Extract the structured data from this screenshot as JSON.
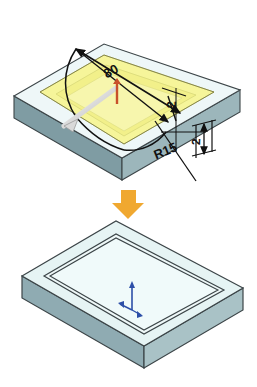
{
  "figure": {
    "background_color": "#ffffff",
    "type": "cad-isometric-illustration"
  },
  "colors": {
    "block_top": "#eef7f8",
    "block_top_lower": "#e6f4f4",
    "block_side_front": "#7f9ca3",
    "block_side_right": "#9cb6bb",
    "block_side_front_lower": "#8fabb2",
    "block_side_right_lower": "#a9c2c6",
    "sketch_fill": "#f6f59a",
    "sketch_fill_deep": "#f2f08a",
    "edge_line": "#3c4548",
    "dimension_line": "#111111",
    "arrow_orange": "#f0a830",
    "handle_gray": "#cfcfcf",
    "handle_red": "#c8502a",
    "axis_blue": "#2d4fa8"
  },
  "upper_model": {
    "name": "block-with-sketch",
    "sketch_region_label": "extrude-cut-profile",
    "dimensions": [
      {
        "id": "length",
        "value": "80",
        "kind": "linear",
        "rotation": -28,
        "x": 113,
        "y": 75
      },
      {
        "id": "width",
        "value": "2",
        "kind": "linear",
        "rotation": -88,
        "x": 174,
        "y": 108
      },
      {
        "id": "corner-radius",
        "value": "R15",
        "kind": "radial",
        "rotation": -22,
        "x": 167,
        "y": 155
      },
      {
        "id": "depth",
        "value": "2",
        "kind": "linear",
        "rotation": -88,
        "x": 200,
        "y": 142
      }
    ]
  },
  "transition": {
    "name": "operation-arrow",
    "direction": "down",
    "glyph": "arrow-down"
  },
  "lower_model": {
    "name": "block-with-groove",
    "result_label": "grooved-block",
    "axis_triad": {
      "name": "origin-triad",
      "labels": [
        "x",
        "y",
        "z"
      ]
    }
  }
}
